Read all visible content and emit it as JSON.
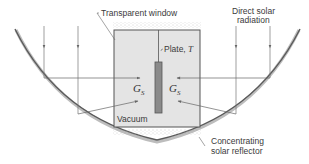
{
  "diagram": {
    "labels": {
      "window": "Transparent window",
      "radiation_line1": "Direct solar",
      "radiation_line2": "radiation",
      "plate_prefix": "Plate, ",
      "plate_symbol": "T",
      "vacuum": "Vacuum",
      "reflector_line1": "Concentrating",
      "reflector_line2": "solar reflector",
      "gs_left": "G",
      "gs_left_sub": "S",
      "gs_right": "G",
      "gs_right_sub": "S"
    },
    "colors": {
      "box_fill": "#e4e4e4",
      "box_stroke": "#555555",
      "plate_fill": "#8a8a8a",
      "reflector": "#6e6e6e",
      "ray": "#666666",
      "text": "#3a3a3a"
    }
  }
}
